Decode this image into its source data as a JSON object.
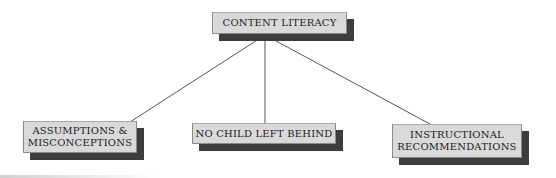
{
  "diagram": {
    "type": "tree",
    "root": {
      "id": "content-literacy",
      "label": "CONTENT LITERACY"
    },
    "children": [
      {
        "id": "assumptions-misconceptions",
        "label_line1": "ASSUMPTIONS &",
        "label_line2": "MISCONCEPTIONS"
      },
      {
        "id": "no-child-left-behind",
        "label_line1": "NO CHILD LEFT BEHIND"
      },
      {
        "id": "instructional-recommendations",
        "label_line1": "INSTRUCTIONAL",
        "label_line2": "RECOMMENDATIONS"
      }
    ],
    "edges": [
      {
        "from": "content-literacy",
        "to": "assumptions-misconceptions"
      },
      {
        "from": "content-literacy",
        "to": "no-child-left-behind"
      },
      {
        "from": "content-literacy",
        "to": "instructional-recommendations"
      }
    ],
    "colors": {
      "node_fill": "#d9d9d9",
      "node_shadow": "#3d3d3d",
      "node_text": "#1a1a1a",
      "connector": "#555555",
      "background": "#ffffff"
    }
  }
}
